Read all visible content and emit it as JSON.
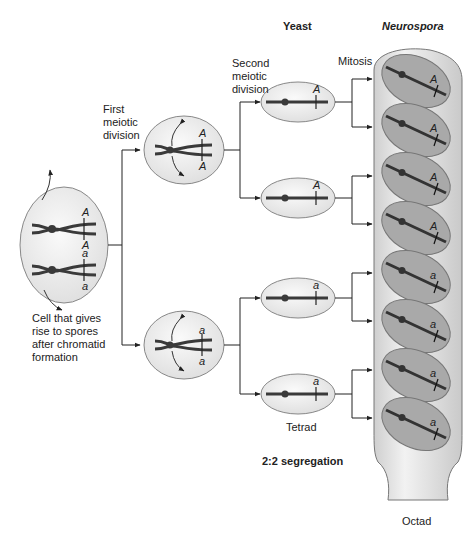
{
  "headers": {
    "yeast": "Yeast",
    "neurospora": "Neurospora"
  },
  "labels": {
    "first_meiotic": "First\nmeiotic\ndivision",
    "second_meiotic": "Second\nmeiotic\ndivision",
    "mitosis": "Mitosis",
    "start_cell": "Cell that gives\nrise to spores\nafter chromatid\nformation",
    "tetrad": "Tetrad",
    "segregation": "2:2 segregation",
    "octad": "Octad"
  },
  "alleles": {
    "start": [
      "A",
      "A",
      "a",
      "a"
    ],
    "meiosis1": [
      [
        "A",
        "A"
      ],
      [
        "a",
        "a"
      ]
    ],
    "tetrad": [
      "A",
      "A",
      "a",
      "a"
    ],
    "octad": [
      "A",
      "A",
      "A",
      "A",
      "a",
      "a",
      "a",
      "a"
    ]
  },
  "colors": {
    "cell_fill": "#ececec",
    "cell_stroke": "#888888",
    "chromosome": "#3a3a3a",
    "ascus_fill": "#dcdcdc",
    "spore_fill": "#a9a9a9"
  }
}
